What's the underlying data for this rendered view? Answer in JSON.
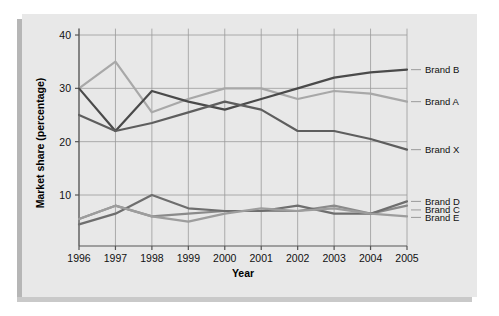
{
  "chart_data": {
    "type": "line",
    "title": "",
    "xlabel": "Year",
    "ylabel": "Market share (percentage)",
    "x": [
      1996,
      1997,
      1998,
      1999,
      2000,
      2001,
      2002,
      2003,
      2004,
      2005
    ],
    "categories": [
      "1996",
      "1997",
      "1998",
      "1999",
      "2000",
      "2001",
      "2002",
      "2003",
      "2004",
      "2005"
    ],
    "xlim": [
      1996,
      2005
    ],
    "ylim": [
      0.4,
      41
    ],
    "yticks": [
      10,
      20,
      30,
      40
    ],
    "ytick_labels": [
      "10",
      "20",
      "30",
      "40"
    ],
    "grid": true,
    "legend_position": "right-outside",
    "series": [
      {
        "name": "Brand A",
        "color": "#a8a8a8",
        "values": [
          30,
          35,
          25.5,
          28,
          30,
          30,
          28,
          29.5,
          29,
          27.5
        ],
        "label_y": 27.5
      },
      {
        "name": "Brand B",
        "color": "#4a4a4a",
        "values": [
          30,
          22,
          29.5,
          27.5,
          26,
          28,
          30,
          32,
          33,
          33.5
        ],
        "label_y": 33.5
      },
      {
        "name": "Brand X",
        "color": "#5e5e5e",
        "values": [
          25,
          22,
          23.5,
          25.5,
          27.5,
          26,
          22,
          22,
          20.5,
          18.5
        ],
        "label_y": 18.5
      },
      {
        "name": "Brand C",
        "color": "#8a8a8a",
        "values": [
          5.5,
          8,
          6,
          6.5,
          7,
          7,
          7,
          8,
          6.5,
          8
        ],
        "label_y": 7.2
      },
      {
        "name": "Brand D",
        "color": "#6e6e6e",
        "values": [
          4.5,
          6.5,
          10,
          7.5,
          7,
          7,
          8,
          6.5,
          6.5,
          8.8
        ],
        "label_y": 8.8
      },
      {
        "name": "Brand E",
        "color": "#9d9d9d",
        "values": [
          5.5,
          8,
          6,
          5,
          6.5,
          7.5,
          7,
          7.5,
          6.5,
          6
        ],
        "label_y": 5.8
      }
    ],
    "legend_entries": [
      {
        "label": "Brand B",
        "color": "#4a4a4a"
      },
      {
        "label": "Brand A",
        "color": "#a8a8a8"
      },
      {
        "label": "Brand X",
        "color": "#5e5e5e"
      },
      {
        "label": "Brand D",
        "color": "#6e6e6e"
      },
      {
        "label": "Brand C",
        "color": "#8a8a8a"
      },
      {
        "label": "Brand E",
        "color": "#9d9d9d"
      }
    ],
    "colors": {
      "panel_background": "#e8e8e8",
      "grid_line": "#9a9a9a",
      "axis_line": "#555555",
      "text": "#111111",
      "page_background": "#ffffff"
    }
  }
}
